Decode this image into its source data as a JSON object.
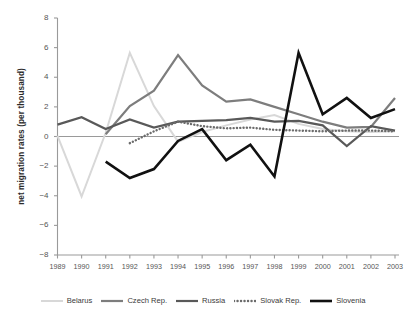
{
  "chart_data": {
    "type": "line",
    "title": "",
    "xlabel": "",
    "ylabel": "net migration rates (per thousand)",
    "x": [
      1989,
      1990,
      1991,
      1992,
      1993,
      1994,
      1995,
      1996,
      1997,
      1998,
      1999,
      2000,
      2001,
      2002,
      2003
    ],
    "xtick_labels": [
      "1989",
      "1990",
      "1991",
      "1992",
      "1993",
      "1994",
      "1995",
      "1996",
      "1997",
      "1998",
      "1999",
      "2000",
      "2001",
      "2002",
      "2003"
    ],
    "ytick_labels": [
      "8",
      "6",
      "4",
      "2",
      "0",
      "−2",
      "−4",
      "−6",
      "−8"
    ],
    "yticks": [
      8,
      6,
      4,
      2,
      0,
      -2,
      -4,
      -6,
      -8
    ],
    "ylim": [
      -8,
      8
    ],
    "xlim": [
      1989,
      2003
    ],
    "grid": false,
    "zero_line": true,
    "legend_position": "bottom",
    "series": [
      {
        "name": "Belarus",
        "color": "#d8d8d8",
        "style": "solid",
        "width": 2.0,
        "values": [
          0.05,
          -4.05,
          0.25,
          5.65,
          2.05,
          -0.35,
          0.3,
          0.75,
          1.15,
          1.45,
          0.85,
          0.5,
          0.35,
          0.3,
          0.35
        ]
      },
      {
        "name": "Czech Rep.",
        "color": "#7d7d7d",
        "style": "solid",
        "width": 2.2,
        "values": [
          null,
          null,
          0.15,
          2.05,
          3.1,
          5.5,
          3.45,
          2.35,
          2.5,
          2.0,
          1.5,
          1.0,
          0.6,
          0.65,
          2.6
        ]
      },
      {
        "name": "Russia",
        "color": "#595959",
        "style": "solid",
        "width": 2.2,
        "values": [
          0.8,
          1.3,
          0.5,
          1.15,
          0.6,
          1.0,
          1.05,
          1.1,
          1.25,
          1.0,
          1.05,
          0.75,
          -0.65,
          0.7,
          0.4
        ]
      },
      {
        "name": "Slovak Rep.",
        "color": "#6b6b6b",
        "style": "dotted",
        "width": 2.4,
        "values": [
          null,
          null,
          null,
          -0.45,
          0.35,
          1.0,
          0.7,
          0.55,
          0.6,
          0.45,
          0.4,
          0.35,
          0.4,
          0.4,
          0.35
        ]
      },
      {
        "name": "Slovenia",
        "color": "#111111",
        "style": "solid",
        "width": 2.6,
        "values": [
          null,
          null,
          -1.7,
          -2.8,
          -2.2,
          -0.3,
          0.5,
          -1.6,
          -0.55,
          -2.7,
          5.65,
          1.5,
          2.6,
          1.25,
          1.85
        ]
      }
    ]
  },
  "legend": {
    "entries": [
      {
        "label": "Belarus"
      },
      {
        "label": "Czech Rep."
      },
      {
        "label": "Russia"
      },
      {
        "label": "Slovak Rep."
      },
      {
        "label": "Slovenia"
      }
    ]
  },
  "axis": {
    "y_title": "net migration rates (per thousand)"
  }
}
